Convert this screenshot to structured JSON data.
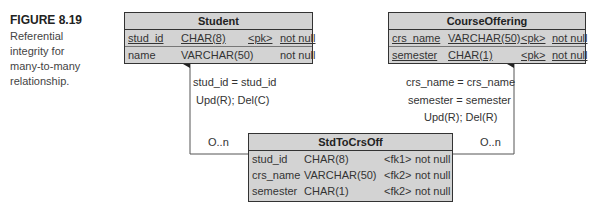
{
  "caption": {
    "figure": "FIGURE 8.19",
    "lines": [
      "Referential",
      "integrity for",
      "many-to-many",
      "relationship."
    ]
  },
  "entities": {
    "student": {
      "name": "Student",
      "rows": [
        {
          "col": "stud_id",
          "type": "CHAR(8)",
          "key": "<pk>",
          "null": "not null",
          "underline": true
        },
        {
          "col": "name",
          "type": "VARCHAR(50)",
          "key": "",
          "null": "not null",
          "underline": false
        }
      ]
    },
    "course_offering": {
      "name": "CourseOffering",
      "rows": [
        {
          "col": "crs_name",
          "type": "VARCHAR(50)",
          "key": "<pk>",
          "null": "not null",
          "underline": true
        },
        {
          "col": "semester",
          "type": "CHAR(1)",
          "key": "<pk>",
          "null": "not null",
          "underline": true
        }
      ]
    },
    "std_to_crs_off": {
      "name": "StdToCrsOff",
      "rows": [
        {
          "col": "stud_id",
          "type": "CHAR(8)",
          "key": "<fk1>",
          "null": "not null"
        },
        {
          "col": "crs_name",
          "type": "VARCHAR(50)",
          "key": "<fk2>",
          "null": "not null"
        },
        {
          "col": "semester",
          "type": "CHAR(1)",
          "key": "<fk2>",
          "null": "not null"
        }
      ]
    }
  },
  "relationships": {
    "left": {
      "join": "stud_id = stud_id",
      "rule": "Upd(R); Del(C)",
      "cardinality": "O..n"
    },
    "right": {
      "join1": "crs_name = crs_name",
      "join2": "semester = semester",
      "rule": "Upd(R); Del(R)",
      "cardinality": "O..n"
    }
  },
  "colors": {
    "entity_fill": "#d3d3d3",
    "border": "#333333",
    "line": "#555555"
  }
}
